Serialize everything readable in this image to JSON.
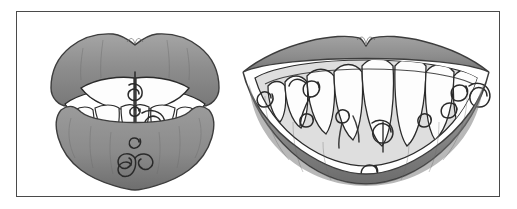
{
  "figure": {
    "title": "Two decorated mouths illustration",
    "frame": {
      "border_color": "#4a4a4a",
      "background_color": "#ffffff"
    },
    "palette": {
      "lip_fill": "#8e8e8e",
      "lip_shadow": "#6f6f6f",
      "lip_highlight": "#a3a3a3",
      "lip_outline": "#3d3d3d",
      "gum_fill": "#d8d8d8",
      "tooth_fill": "#fdfdfd",
      "tooth_outline": "#2b2b2b",
      "mouth_interior": "#ffffff",
      "ornament_stroke": "#2a2a2a",
      "page_background": "#ffffff"
    },
    "panels": [
      {
        "id": "left-mouth",
        "name": "Closed pursed lips with pierced teeth",
        "mouth_state": "closed",
        "view": "frontal",
        "upper_lip": "full cupid's bow upper lip",
        "lower_lip": "rounded lower lip with vertical texture creases",
        "teeth_visible_upper": 2,
        "teeth_visible_lower": 7,
        "ornaments": [
          {
            "type": "spiral",
            "location": "upper central incisor",
            "turns": 2
          },
          {
            "type": "spiral",
            "location": "between central incisors",
            "turns": 2
          },
          {
            "type": "spiral",
            "location": "lower central incisor",
            "turns": 3
          },
          {
            "type": "spiral",
            "location": "lower lateral incisor",
            "turns": 2
          },
          {
            "type": "spiral",
            "location": "chin side of lower lip",
            "turns": 2
          },
          {
            "type": "triskele",
            "location": "lower lip centre",
            "turns": 3
          }
        ],
        "ornament_count": 6
      },
      {
        "id": "right-mouth",
        "name": "Open smile with pierced teeth",
        "mouth_state": "open smile",
        "view": "frontal",
        "upper_lip": "thin upper lip with pronounced cupid's bow",
        "lower_lip": "wide full lower lip with vertical texture creases",
        "teeth_visible_upper": 12,
        "teeth_visible_lower": 0,
        "ornaments": [
          {
            "type": "spiral",
            "location": "far-left gum corner",
            "turns": 2
          },
          {
            "type": "spiral",
            "location": "left canine",
            "turns": 2
          },
          {
            "type": "spiral",
            "location": "left lateral incisor edge",
            "turns": 2
          },
          {
            "type": "spiral",
            "location": "left central incisor edge",
            "turns": 2
          },
          {
            "type": "spiral",
            "location": "central incisor midline",
            "turns": 3
          },
          {
            "type": "spiral",
            "location": "right central incisor edge",
            "turns": 2
          },
          {
            "type": "spiral",
            "location": "right lateral incisor edge",
            "turns": 2
          },
          {
            "type": "spiral",
            "location": "right canine",
            "turns": 2
          },
          {
            "type": "spiral",
            "location": "far-right gum corner",
            "turns": 2
          },
          {
            "type": "spiral",
            "location": "lower lip centre",
            "turns": 2
          }
        ],
        "ornament_count": 10
      }
    ]
  }
}
